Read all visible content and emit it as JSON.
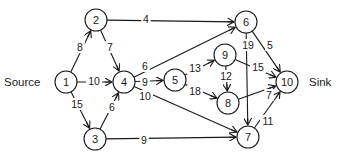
{
  "diagram": {
    "type": "flow-network",
    "source_label": "Source",
    "sink_label": "Sink",
    "colors": {
      "stroke": "#1a1a1a",
      "background": "#ffffff"
    },
    "nodes": [
      {
        "id": "1",
        "label": "1",
        "x": 66,
        "y": 82
      },
      {
        "id": "2",
        "label": "2",
        "x": 96,
        "y": 20
      },
      {
        "id": "3",
        "label": "3",
        "x": 95,
        "y": 139
      },
      {
        "id": "4",
        "label": "4",
        "x": 124,
        "y": 82
      },
      {
        "id": "5",
        "label": "5",
        "x": 175,
        "y": 80
      },
      {
        "id": "6",
        "label": "6",
        "x": 246,
        "y": 22
      },
      {
        "id": "7",
        "label": "7",
        "x": 248,
        "y": 137
      },
      {
        "id": "8",
        "label": "8",
        "x": 228,
        "y": 103
      },
      {
        "id": "9",
        "label": "9",
        "x": 225,
        "y": 55
      },
      {
        "id": "10",
        "label": "10",
        "x": 287,
        "y": 82
      }
    ],
    "edges": [
      {
        "from": "1",
        "to": "2",
        "capacity": "8",
        "lx": 80,
        "ly": 47
      },
      {
        "from": "1",
        "to": "4",
        "capacity": "10",
        "lx": 94,
        "ly": 81
      },
      {
        "from": "1",
        "to": "3",
        "capacity": "15",
        "lx": 77,
        "ly": 104
      },
      {
        "from": "2",
        "to": "6",
        "capacity": "4",
        "lx": 146,
        "ly": 19
      },
      {
        "from": "2",
        "to": "4",
        "capacity": "7",
        "lx": 110,
        "ly": 47
      },
      {
        "from": "3",
        "to": "4",
        "capacity": "6",
        "lx": 112,
        "ly": 107
      },
      {
        "from": "3",
        "to": "7",
        "capacity": "9",
        "lx": 144,
        "ly": 140
      },
      {
        "from": "4",
        "to": "6",
        "capacity": "6",
        "lx": 145,
        "ly": 66
      },
      {
        "from": "4",
        "to": "5",
        "capacity": "9",
        "lx": 145,
        "ly": 82
      },
      {
        "from": "4",
        "to": "7",
        "capacity": "10",
        "lx": 145,
        "ly": 96
      },
      {
        "from": "5",
        "to": "9",
        "capacity": "13",
        "lx": 195,
        "ly": 68
      },
      {
        "from": "5",
        "to": "8",
        "capacity": "18",
        "lx": 195,
        "ly": 91
      },
      {
        "from": "6",
        "to": "10",
        "capacity": "5",
        "lx": 270,
        "ly": 45
      },
      {
        "from": "6",
        "to": "7",
        "capacity": "19",
        "lx": 248,
        "ly": 45
      },
      {
        "from": "9",
        "to": "10",
        "capacity": "15",
        "lx": 258,
        "ly": 67
      },
      {
        "from": "9",
        "to": "8",
        "capacity": "12",
        "lx": 226,
        "ly": 76
      },
      {
        "from": "8",
        "to": "10",
        "capacity": "7",
        "lx": 269,
        "ly": 95
      },
      {
        "from": "7",
        "to": "10",
        "capacity": "11",
        "lx": 268,
        "ly": 121
      }
    ]
  }
}
